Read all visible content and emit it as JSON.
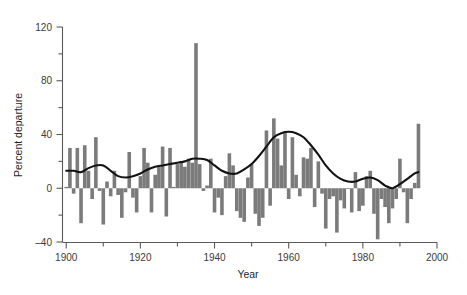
{
  "chart_data": {
    "type": "bar",
    "title": "",
    "xlabel": "Year",
    "ylabel": "Percent departure",
    "xlim": [
      1899,
      2000
    ],
    "ylim": [
      -40,
      120
    ],
    "grid": false,
    "legend": null,
    "x_ticks_major": [
      1900,
      1920,
      1940,
      1960,
      1980,
      2000
    ],
    "x_ticks_minor": [
      1910,
      1930,
      1950,
      1970,
      1990
    ],
    "y_ticks_major": [
      -40,
      0,
      40,
      80,
      120
    ],
    "y_ticks_minor": [
      -20,
      20,
      60,
      100
    ],
    "bar_color": "#7b7b7b",
    "trend_color": "#121212",
    "series": [
      {
        "name": "Annual percent departure",
        "type": "bar",
        "x": [
          1900,
          1901,
          1902,
          1903,
          1904,
          1905,
          1906,
          1907,
          1908,
          1909,
          1910,
          1911,
          1912,
          1913,
          1914,
          1915,
          1916,
          1917,
          1918,
          1919,
          1920,
          1921,
          1922,
          1923,
          1924,
          1925,
          1926,
          1927,
          1928,
          1929,
          1930,
          1931,
          1932,
          1933,
          1934,
          1935,
          1936,
          1937,
          1938,
          1939,
          1940,
          1941,
          1942,
          1943,
          1944,
          1945,
          1946,
          1947,
          1948,
          1949,
          1950,
          1951,
          1952,
          1953,
          1954,
          1955,
          1956,
          1957,
          1958,
          1959,
          1960,
          1961,
          1962,
          1963,
          1964,
          1965,
          1966,
          1967,
          1968,
          1969,
          1970,
          1971,
          1972,
          1973,
          1974,
          1975,
          1976,
          1977,
          1978,
          1979,
          1980,
          1981,
          1982,
          1983,
          1984,
          1985,
          1986,
          1987,
          1988,
          1989,
          1990,
          1991,
          1992,
          1993,
          1994,
          1995
        ],
        "values": [
          1,
          30,
          -4,
          30,
          -26,
          32,
          13,
          -8,
          38,
          -2,
          -27,
          5,
          -6,
          13,
          -5,
          -22,
          -3,
          27,
          -7,
          -18,
          9,
          30,
          19,
          -18,
          10,
          16,
          31,
          -21,
          30,
          1,
          18,
          20,
          16,
          22,
          19,
          108,
          18,
          -2,
          2,
          22,
          -18,
          -7,
          -20,
          9,
          26,
          17,
          -17,
          -22,
          -25,
          8,
          18,
          -19,
          -28,
          -22,
          43,
          -13,
          52,
          37,
          17,
          42,
          -8,
          38,
          10,
          -6,
          23,
          22,
          30,
          -14,
          20,
          -4,
          -30,
          -8,
          -6,
          -33,
          -9,
          -15,
          0,
          -18,
          12,
          -17,
          -13,
          9,
          13,
          -19,
          -38,
          -8,
          -14,
          -26,
          -15,
          -8,
          22,
          -3,
          -26,
          -8,
          4,
          48
        ]
      },
      {
        "name": "Smoothed trend",
        "type": "line",
        "x": [
          1900,
          1902,
          1904,
          1906,
          1908,
          1910,
          1912,
          1914,
          1916,
          1918,
          1920,
          1922,
          1924,
          1926,
          1928,
          1930,
          1932,
          1934,
          1936,
          1938,
          1940,
          1942,
          1944,
          1946,
          1948,
          1950,
          1952,
          1954,
          1956,
          1958,
          1960,
          1962,
          1964,
          1966,
          1968,
          1970,
          1972,
          1974,
          1976,
          1978,
          1980,
          1982,
          1984,
          1986,
          1988,
          1990,
          1992,
          1994,
          1995
        ],
        "values": [
          13,
          13,
          12,
          15,
          17,
          17,
          13,
          9,
          8,
          9,
          11,
          14,
          16,
          17,
          18,
          19,
          20,
          22,
          22,
          21,
          17,
          13,
          11,
          11,
          14,
          18,
          24,
          31,
          38,
          41,
          42,
          41,
          38,
          32,
          25,
          17,
          11,
          7,
          5,
          5,
          7,
          8,
          6,
          2,
          0,
          3,
          7,
          11,
          12
        ]
      }
    ]
  }
}
